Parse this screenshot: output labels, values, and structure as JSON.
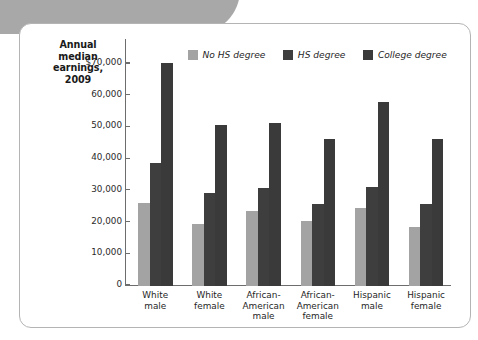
{
  "figure": {
    "title_lines": [
      "Annual",
      "median",
      "earnings,",
      "2009"
    ],
    "title_text": "Annual median earnings, 2009",
    "colors": {
      "no_hs_degree": "#a3a3a3",
      "hs_degree": "#3e3e3e",
      "college_degree": "#3a3a3a",
      "axis": "#6d6d6d",
      "card_border": "#b4b4b4",
      "corner_tab": "#a8a8a8",
      "text": "#1f1f1f"
    }
  },
  "chart_data": {
    "type": "bar",
    "xlabel": "",
    "ylabel": "Annual median earnings, 2009",
    "ylim": [
      0,
      73000
    ],
    "grid": false,
    "legend_position": "top-center",
    "ytick_labels": [
      "$70,000",
      "60,000",
      "50,000",
      "40,000",
      "30,000",
      "20,000",
      "10,000",
      "0"
    ],
    "ytick_values": [
      70000,
      60000,
      50000,
      40000,
      30000,
      20000,
      10000,
      0
    ],
    "categories": [
      "White\nmale",
      "White\nfemale",
      "African-\nAmerican\nmale",
      "African-\nAmerican\nfemale",
      "Hispanic\nmale",
      "Hispanic\nfemale"
    ],
    "series": [
      {
        "name": "No HS degree",
        "color": "#a3a3a3",
        "values": [
          26300,
          19700,
          23700,
          20500,
          24600,
          18700
        ]
      },
      {
        "name": "HS degree",
        "color": "#3e3e3e",
        "values": [
          38700,
          29200,
          30900,
          26000,
          31300,
          26000
        ]
      },
      {
        "name": "College degree",
        "color": "#3a3a3a",
        "values": [
          70300,
          50900,
          51500,
          46300,
          58000,
          46300
        ]
      }
    ]
  }
}
